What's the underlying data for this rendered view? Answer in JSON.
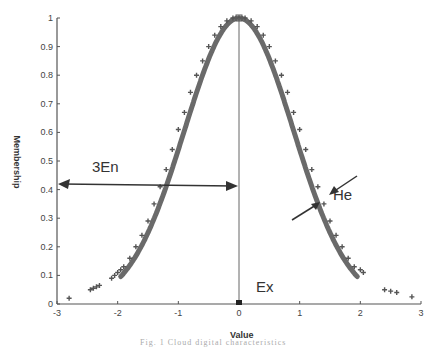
{
  "chart_data": {
    "type": "scatter",
    "title": "",
    "xlabel": "Value",
    "ylabel": "Membership",
    "xlim": [
      -3,
      3
    ],
    "ylim": [
      0,
      1
    ],
    "xticks": [
      -3,
      -2,
      -1,
      0,
      1,
      2,
      3
    ],
    "yticks": [
      0,
      0.1,
      0.2,
      0.3,
      0.4,
      0.5,
      0.6,
      0.7,
      0.8,
      0.9,
      1
    ],
    "grid": false,
    "legend": null,
    "series": [
      {
        "name": "cloud drops",
        "marker": "+",
        "color": "#555555",
        "description": "Normal cloud drops forming a Gaussian-shaped membership curve centered at Ex=0, peak 1",
        "x": [
          -2.8,
          -2.45,
          -2.4,
          -2.35,
          -2.3,
          -2.1,
          -2.05,
          -2.0,
          -1.95,
          -1.9,
          -1.8,
          -1.7,
          -1.6,
          -1.5,
          -1.4,
          -1.3,
          -1.2,
          -1.1,
          -1.0,
          -0.9,
          -0.8,
          -0.7,
          -0.6,
          -0.5,
          -0.4,
          -0.3,
          -0.2,
          -0.1,
          0.0,
          0.1,
          0.2,
          0.3,
          0.4,
          0.5,
          0.6,
          0.7,
          0.8,
          0.9,
          1.0,
          1.1,
          1.2,
          1.3,
          1.4,
          1.5,
          1.6,
          1.7,
          1.8,
          1.9,
          2.0,
          2.05,
          2.4,
          2.5,
          2.6,
          2.85
        ],
        "y": [
          0.02,
          0.05,
          0.055,
          0.06,
          0.065,
          0.09,
          0.1,
          0.11,
          0.12,
          0.13,
          0.16,
          0.2,
          0.24,
          0.29,
          0.35,
          0.41,
          0.47,
          0.54,
          0.61,
          0.67,
          0.74,
          0.8,
          0.85,
          0.9,
          0.94,
          0.97,
          0.99,
          1.0,
          1.0,
          1.0,
          0.99,
          0.97,
          0.94,
          0.9,
          0.85,
          0.8,
          0.74,
          0.67,
          0.61,
          0.54,
          0.47,
          0.41,
          0.35,
          0.29,
          0.24,
          0.2,
          0.16,
          0.13,
          0.12,
          0.11,
          0.05,
          0.045,
          0.04,
          0.025
        ]
      }
    ],
    "annotations": [
      {
        "text": "3En",
        "type": "double-arrow",
        "from": [
          0,
          0.42
        ],
        "to": [
          -3,
          0.42
        ]
      },
      {
        "text": "He",
        "type": "converging-arrows",
        "at": [
          1.45,
          0.37
        ]
      },
      {
        "text": "Ex",
        "type": "vertical-line",
        "x": 0,
        "y_range": [
          0,
          1
        ]
      }
    ]
  },
  "labels": {
    "xlabel": "Value",
    "ylabel": "Membership",
    "en": "3En",
    "he": "He",
    "ex": "Ex",
    "caption": "Fig. 1   Cloud digital characteristics"
  }
}
